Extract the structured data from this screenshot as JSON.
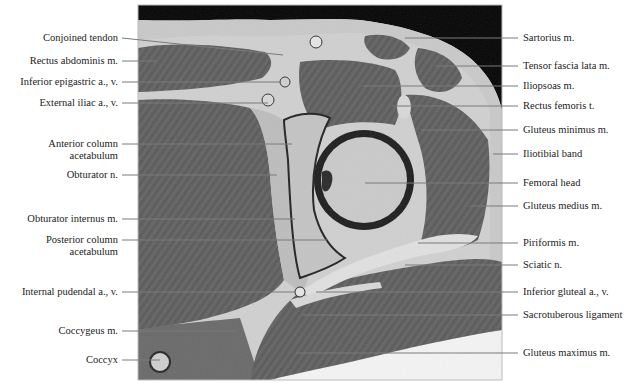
{
  "figure": {
    "image_panel": {
      "x": 138,
      "y": 5,
      "width": 364,
      "height": 375
    }
  },
  "labels_left": [
    {
      "id": "conjoined-tendon",
      "text": "Conjoined tendon",
      "y": 38,
      "tx": 283,
      "ty": 55
    },
    {
      "id": "rectus-abdominis",
      "text": "Rectus abdominis m.",
      "y": 61,
      "tx": 157,
      "ty": 61
    },
    {
      "id": "inferior-epigastric",
      "text": "Inferior epigastric a., v.",
      "y": 82,
      "tx": 280,
      "ty": 82
    },
    {
      "id": "external-iliac",
      "text": "External iliac a., v.",
      "y": 103,
      "tx": 268,
      "ty": 103
    },
    {
      "id": "anterior-column-1",
      "text": "Anterior column",
      "line2": "acetabulum",
      "y": 144,
      "tx": 292,
      "ty": 144
    },
    {
      "id": "obturator-n",
      "text": "Obturator n.",
      "y": 175,
      "tx": 277,
      "ty": 175
    },
    {
      "id": "obturator-internus",
      "text": "Obturator internus m.",
      "y": 219,
      "tx": 295,
      "ty": 219
    },
    {
      "id": "posterior-column",
      "text": "Posterior column",
      "line2": "acetabulum",
      "y": 240,
      "tx": 327,
      "ty": 240
    },
    {
      "id": "internal-pudendal",
      "text": "Internal pudendal a., v.",
      "y": 292,
      "tx": 296,
      "ty": 292
    },
    {
      "id": "coccygeus",
      "text": "Coccygeus m.",
      "y": 331,
      "tx": 235,
      "ty": 331
    },
    {
      "id": "coccyx",
      "text": "Coccyx",
      "y": 360,
      "tx": 160,
      "ty": 360
    }
  ],
  "labels_right": [
    {
      "id": "sartorius",
      "text": "Sartorius m.",
      "y": 38,
      "tx": 405,
      "ty": 38
    },
    {
      "id": "tensor-fascia-lata",
      "text": "Tensor fascia lata m.",
      "y": 66,
      "tx": 435,
      "ty": 66
    },
    {
      "id": "iliopsoas",
      "text": "Iliopsoas m.",
      "y": 86,
      "tx": 363,
      "ty": 86
    },
    {
      "id": "rectus-femoris",
      "text": "Rectus femoris t.",
      "y": 106,
      "tx": 392,
      "ty": 106
    },
    {
      "id": "gluteus-minimus",
      "text": "Gluteus minimus m.",
      "y": 130,
      "tx": 421,
      "ty": 130
    },
    {
      "id": "iliotibial-band",
      "text": "Iliotibial band",
      "y": 154,
      "tx": 493,
      "ty": 154
    },
    {
      "id": "femoral-head",
      "text": "Femoral head",
      "y": 183,
      "tx": 365,
      "ty": 183
    },
    {
      "id": "gluteus-medius",
      "text": "Gluteus medius m.",
      "y": 206,
      "tx": 470,
      "ty": 206
    },
    {
      "id": "piriformis",
      "text": "Piriformis m.",
      "y": 243,
      "tx": 418,
      "ty": 243
    },
    {
      "id": "sciatic-n",
      "text": "Sciatic n.",
      "y": 265,
      "tx": 405,
      "ty": 265
    },
    {
      "id": "inferior-gluteal",
      "text": "Inferior gluteal a., v.",
      "y": 292,
      "tx": 316,
      "ty": 292
    },
    {
      "id": "sacrotuberous",
      "text": "Sacrotuberous ligament",
      "y": 315,
      "tx": 302,
      "ty": 315
    },
    {
      "id": "gluteus-maximus",
      "text": "Gluteus maximus m.",
      "y": 353,
      "tx": 296,
      "ty": 353
    }
  ],
  "colors": {
    "background": "#ffffff",
    "air": "#050505",
    "fat": "#d4d4d4",
    "muscle": "#5e5e5e",
    "bone_marrow": "#c8c8c8",
    "cortex": "#1e1e1e",
    "leader_line": "#7a7a7a",
    "label_text": "#222222"
  }
}
